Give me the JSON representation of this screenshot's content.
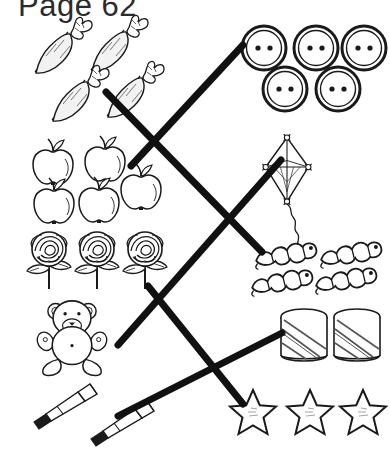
{
  "page": {
    "title": "Page 62",
    "type": "matching-worksheet",
    "ink_color": "#1a1a1a",
    "paper_color": "#ffffff",
    "width": 390,
    "height": 454
  },
  "left_column": [
    {
      "id": "carrots",
      "label": "carrots",
      "count": 4,
      "icon": "carrot-icon"
    },
    {
      "id": "apples",
      "label": "apples",
      "count": 5,
      "icon": "apple-icon"
    },
    {
      "id": "roses",
      "label": "roses",
      "count": 3,
      "icon": "rose-icon"
    },
    {
      "id": "bear",
      "label": "teddy bear",
      "count": 1,
      "icon": "teddy-bear-icon"
    },
    {
      "id": "pencils",
      "label": "pencils",
      "count": 2,
      "icon": "pencil-icon"
    }
  ],
  "right_column": [
    {
      "id": "buttons",
      "label": "buttons",
      "count": 5,
      "icon": "button-icon"
    },
    {
      "id": "kite",
      "label": "kite",
      "count": 1,
      "icon": "kite-icon"
    },
    {
      "id": "worms",
      "label": "caterpillars",
      "count": 4,
      "icon": "caterpillar-icon"
    },
    {
      "id": "drums",
      "label": "drums",
      "count": 2,
      "icon": "drum-icon"
    },
    {
      "id": "stars",
      "label": "stars",
      "count": 3,
      "icon": "star-icon"
    }
  ],
  "connections": [
    {
      "from": "carrots",
      "to": "worms",
      "count": 4,
      "x1": 106,
      "y1": 92,
      "x2": 262,
      "y2": 252
    },
    {
      "from": "apples",
      "to": "buttons",
      "count": 5,
      "x1": 131,
      "y1": 166,
      "x2": 243,
      "y2": 45
    },
    {
      "from": "roses",
      "to": "stars",
      "count": 3,
      "x1": 148,
      "y1": 286,
      "x2": 243,
      "y2": 404
    },
    {
      "from": "bear",
      "to": "kite",
      "count": 1,
      "x1": 118,
      "y1": 345,
      "x2": 281,
      "y2": 160
    },
    {
      "from": "pencils",
      "to": "drums",
      "count": 2,
      "x1": 118,
      "y1": 416,
      "x2": 282,
      "y2": 333
    }
  ]
}
